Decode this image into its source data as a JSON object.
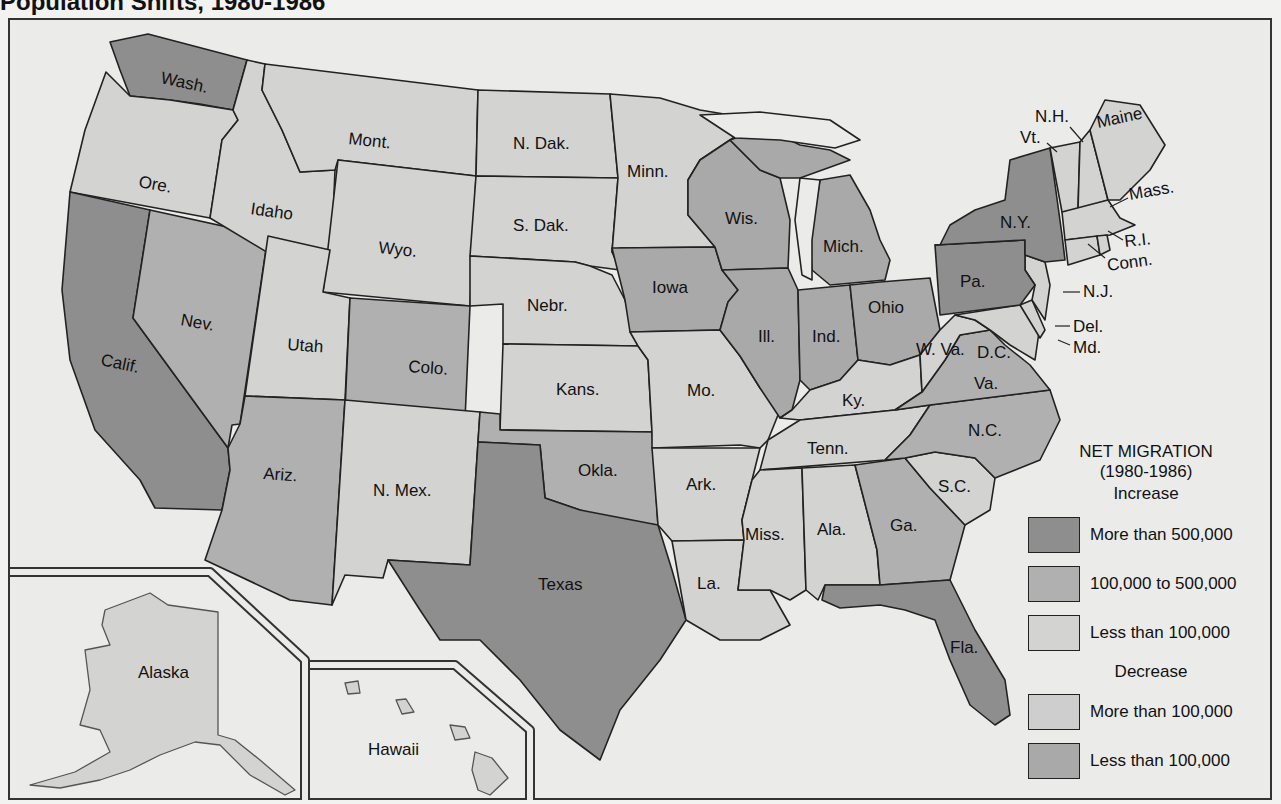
{
  "title": "Population Shifts, 1980-1986",
  "legend": {
    "title": "NET MIGRATION",
    "period": "(1980-1986)",
    "increase_label": "Increase",
    "decrease_label": "Decrease",
    "items": [
      {
        "group": "Increase",
        "label": "More than 500,000",
        "color": "#8e8e8e"
      },
      {
        "group": "Increase",
        "label": "100,000 to 500,000",
        "color": "#b0b0b0"
      },
      {
        "group": "Increase",
        "label": "Less than 100,000",
        "color": "#d3d3d2"
      },
      {
        "group": "Decrease",
        "label": "More than 100,000",
        "color": "#cecece"
      },
      {
        "group": "Decrease",
        "label": "Less than 100,000",
        "color": "#a9a9a9"
      }
    ]
  },
  "states": {
    "wash": "Wash.",
    "ore": "Ore.",
    "calif": "Calif.",
    "idaho": "Idaho",
    "nev": "Nev.",
    "mont": "Mont.",
    "wyo": "Wyo.",
    "utah": "Utah",
    "colo": "Colo.",
    "ariz": "Ariz.",
    "nmex": "N. Mex.",
    "ndak": "N. Dak.",
    "sdak": "S. Dak.",
    "nebr": "Nebr.",
    "kans": "Kans.",
    "okla": "Okla.",
    "texas": "Texas",
    "minn": "Minn.",
    "iowa": "Iowa",
    "mo": "Mo.",
    "ark": "Ark.",
    "la": "La.",
    "wis": "Wis.",
    "ill": "Ill.",
    "mich": "Mich.",
    "ind": "Ind.",
    "ohio": "Ohio",
    "ky": "Ky.",
    "tenn": "Tenn.",
    "miss": "Miss.",
    "ala": "Ala.",
    "ga": "Ga.",
    "fla": "Fla.",
    "sc": "S.C.",
    "nc": "N.C.",
    "va": "Va.",
    "wva": "W. Va.",
    "dc": "D.C.",
    "md": "Md.",
    "del": "Del.",
    "nj": "N.J.",
    "pa": "Pa.",
    "ny": "N.Y.",
    "vt": "Vt.",
    "nh": "N.H.",
    "maine": "Maine",
    "mass": "Mass.",
    "ri": "R.I.",
    "conn": "Conn.",
    "alaska": "Alaska",
    "hawaii": "Hawaii"
  },
  "classification": {
    "more_than_500k_increase": [
      "Wash.",
      "Calif.",
      "Texas",
      "Fla.",
      "N.Y.",
      "Pa."
    ],
    "100k_to_500k_increase": [
      "Nev.",
      "Colo.",
      "Ariz.",
      "Okla.",
      "Ga.",
      "N.C.",
      "Va."
    ],
    "less_than_100k_increase": [
      "Ore.",
      "Idaho",
      "Mont.",
      "Wyo.",
      "Utah",
      "N. Mex.",
      "N. Dak.",
      "S. Dak.",
      "Nebr.",
      "Kans.",
      "Minn.",
      "Mo.",
      "Ark.",
      "La.",
      "Ky.",
      "Tenn.",
      "Miss.",
      "Ala.",
      "S.C.",
      "W. Va.",
      "Md.",
      "Del.",
      "N.J.",
      "Vt.",
      "N.H.",
      "Maine",
      "Mass.",
      "R.I.",
      "Conn.",
      "Alaska",
      "Hawaii"
    ],
    "decrease_less_than_100k": [
      "Iowa",
      "Wis.",
      "Ill.",
      "Mich.",
      "Ind.",
      "Ohio"
    ]
  }
}
